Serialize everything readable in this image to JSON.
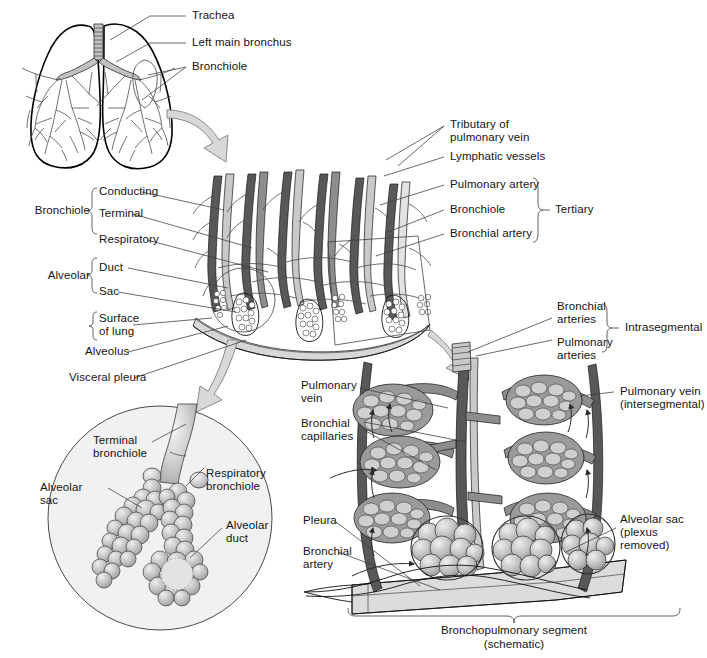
{
  "figure": {
    "panels": {
      "lungs": {
        "name": "Bronchial tree in lungs",
        "labels": [
          {
            "id": "trachea",
            "text": "Trachea"
          },
          {
            "id": "left-main-bronchus",
            "text": "Left main bronchus"
          },
          {
            "id": "bronchiole",
            "text": "Bronchiole"
          }
        ]
      },
      "segment": {
        "name": "Tertiary bronchopulmonary segment detail",
        "left_groups": [
          {
            "group_label": "Bronchiole",
            "items": [
              "Conducting",
              "Terminal",
              "Respiratory"
            ]
          },
          {
            "group_label": "Alveolar",
            "items": [
              "Duct",
              "Sac"
            ]
          },
          {
            "group_label": "",
            "items": [
              "Surface\nof lung"
            ]
          }
        ],
        "left_plain_labels": [
          "Alveolus",
          "Visceral pleura"
        ],
        "right_labels": [
          {
            "text": "Tributary of\npulmonary vein",
            "in_brace": false
          },
          {
            "text": "Lymphatic vessels",
            "in_brace": false
          },
          {
            "text": "Pulmonary artery",
            "in_brace": true
          },
          {
            "text": "Bronchiole",
            "in_brace": true
          },
          {
            "text": "Bronchial artery",
            "in_brace": true
          }
        ],
        "right_brace_label": "Tertiary"
      },
      "inset": {
        "name": "Acinus magnified inset",
        "labels": [
          {
            "id": "terminal-bronchiole",
            "text": "Terminal\nbronchiole"
          },
          {
            "id": "alveolar-sac",
            "text": "Alveolar\nsac"
          },
          {
            "id": "respiratory-bronchiole",
            "text": "Respiratory\nbronchiole"
          },
          {
            "id": "alveolar-duct",
            "text": "Alveolar\nduct"
          }
        ]
      },
      "schematic": {
        "name": "Bronchopulmonary segment schematic",
        "brace_label": "Intrasegmental",
        "brace_items": [
          "Bronchial\narteries",
          "Pulmonary\narteries"
        ],
        "left_labels": [
          {
            "id": "pulmonary-vein",
            "text": "Pulmonary\nvein"
          },
          {
            "id": "bronchial-capillaries",
            "text": "Bronchial\ncapillaries"
          },
          {
            "id": "pleura",
            "text": "Pleura"
          },
          {
            "id": "bronchial-artery",
            "text": "Bronchial\nartery"
          }
        ],
        "right_labels": [
          {
            "id": "pulmonary-vein-intersegmental",
            "text": "Pulmonary vein\n(intersegmental)"
          },
          {
            "id": "alveolar-sac-plexus-removed",
            "text": "Alveolar sac\n(plexus\nremoved)"
          }
        ],
        "caption": "Bronchopulmonary segment\n(schematic)"
      }
    },
    "colors": {
      "ink": "#111111",
      "leader": "#3a3a3a",
      "vessel_dark": "#58585a",
      "vessel_mid": "#8d8d8f",
      "vessel_light": "#c9c9cb",
      "arrow_fill": "#d8d8d8",
      "background": "#ffffff"
    }
  }
}
